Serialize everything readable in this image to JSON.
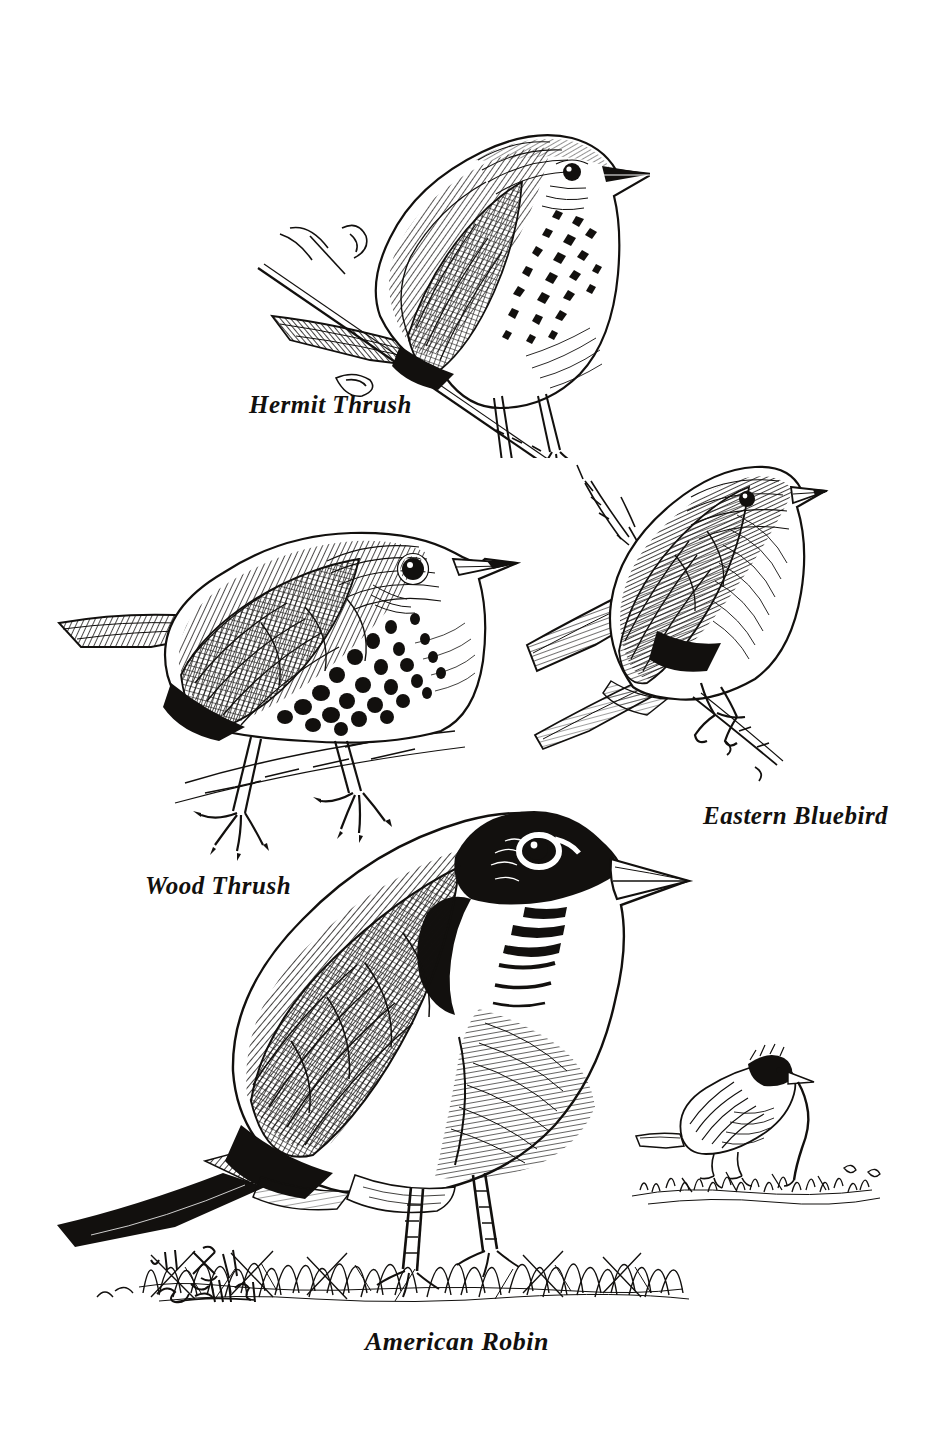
{
  "plate": {
    "medium": "pen-and-ink line drawing",
    "background_color": "#ffffff",
    "ink_color": "#12100e",
    "width": 925,
    "height": 1435,
    "subject": "Thrush family birds plate"
  },
  "labels": {
    "hermit_thrush": "Hermit Thrush",
    "wood_thrush": "Wood Thrush",
    "eastern_bluebird": "Eastern Bluebird",
    "american_robin": "American Robin"
  },
  "figures": [
    {
      "id": "hermit-thrush",
      "name": "Hermit Thrush",
      "label": "Hermit Thrush",
      "label_position": {
        "x": 249,
        "y": 391
      },
      "pose": "perched on a slender twig, facing right, head raised",
      "features": "spotted buff breast, crosshatched brown back, reddish tail, thin dark bill",
      "bounds": {
        "x": 255,
        "y": 80,
        "width": 385,
        "height": 375
      }
    },
    {
      "id": "wood-thrush",
      "name": "Wood Thrush",
      "label": "Wood Thrush",
      "label_position": {
        "x": 145,
        "y": 872
      },
      "pose": "standing on ground, facing right, body in profile",
      "features": "bold round black spots on white breast, heavily hatched mantle, long pale legs with splayed claws",
      "bounds": {
        "x": 60,
        "y": 520,
        "width": 455,
        "height": 340
      }
    },
    {
      "id": "eastern-bluebird",
      "name": "Eastern Bluebird",
      "label": "Eastern Bluebird",
      "label_position": {
        "x": 703,
        "y": 802
      },
      "pose": "perched upright on a small broken twig, facing right",
      "features": "uniformly dark hatched upperparts, paler breast, stubby bill, long folded wing and tail",
      "bounds": {
        "x": 530,
        "y": 440,
        "width": 305,
        "height": 340
      }
    },
    {
      "id": "american-robin",
      "name": "American Robin",
      "label": "American Robin",
      "label_position": {
        "x": 365,
        "y": 1327
      },
      "pose": "standing in grass, facing right, large central figure",
      "features": "black head with broken white eye ring, pale yellow bill, streaked white throat, dark gray back, long solid black tail",
      "bounds": {
        "x": 60,
        "y": 800,
        "width": 620,
        "height": 510
      }
    },
    {
      "id": "robin-with-worm",
      "name": "Robin pulling worm",
      "label": "",
      "pose": "small vignette sketch, robin bent forward tugging an earthworm from turf",
      "features": "loose quick line work, grass tufts, worm stretched from ground to bill",
      "bounds": {
        "x": 625,
        "y": 1025,
        "width": 270,
        "height": 185
      }
    }
  ],
  "ground": {
    "grass_band": "scribbled grass strokes spanning beneath the American Robin",
    "grass_bounds": {
      "x": 140,
      "y": 1195,
      "width": 580,
      "height": 120
    }
  },
  "signature": {
    "present": true,
    "style": "cursive artist signature, illegible",
    "position": {
      "x": 145,
      "y": 1238
    }
  }
}
